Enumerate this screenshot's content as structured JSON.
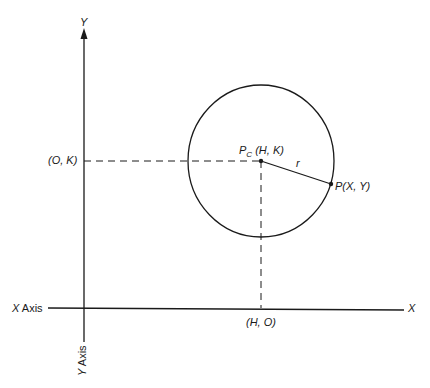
{
  "diagram": {
    "type": "circle-in-cartesian-plane",
    "axes": {
      "x_axis_label": "X Axis",
      "x_end_label": "X",
      "y_axis_label": "Y Axis",
      "y_end_label": "Y"
    },
    "points": {
      "center_symbol": "P",
      "center_subscript": "C",
      "center_coords": "(H, K)",
      "point_label": "P(X, Y)",
      "radius_label": "r",
      "y_intercept_label": "(O, K)",
      "x_intercept_label": "(H, O)"
    },
    "colors": {
      "stroke": "#1a1a1a",
      "background": "#ffffff"
    }
  }
}
